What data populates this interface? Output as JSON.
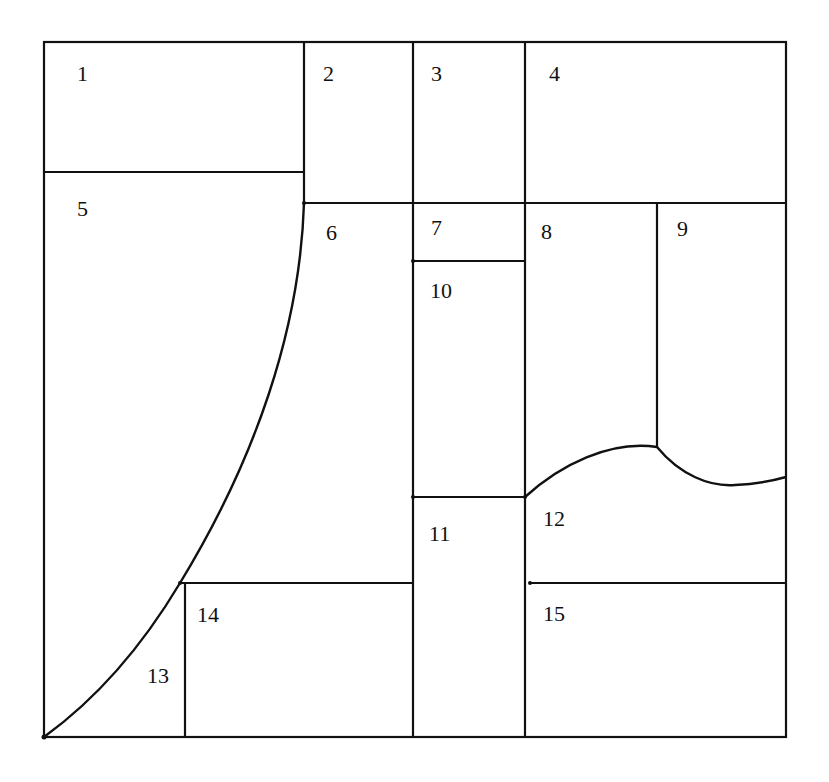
{
  "diagram": {
    "type": "dissection-puzzle",
    "stroke_color": "#111111",
    "background": "#ffffff",
    "regions": [
      {
        "id": "1",
        "label": "1",
        "x": 77,
        "y": 81
      },
      {
        "id": "2",
        "label": "2",
        "x": 323,
        "y": 81
      },
      {
        "id": "3",
        "label": "3",
        "x": 431,
        "y": 81
      },
      {
        "id": "4",
        "label": "4",
        "x": 549,
        "y": 81
      },
      {
        "id": "5",
        "label": "5",
        "x": 77,
        "y": 216
      },
      {
        "id": "6",
        "label": "6",
        "x": 326,
        "y": 240
      },
      {
        "id": "7",
        "label": "7",
        "x": 431,
        "y": 235
      },
      {
        "id": "8",
        "label": "8",
        "x": 541,
        "y": 239
      },
      {
        "id": "9",
        "label": "9",
        "x": 677,
        "y": 236
      },
      {
        "id": "10",
        "label": "10",
        "x": 430,
        "y": 298
      },
      {
        "id": "11",
        "label": "11",
        "x": 429,
        "y": 541
      },
      {
        "id": "12",
        "label": "12",
        "x": 543,
        "y": 526
      },
      {
        "id": "13",
        "label": "13",
        "x": 147,
        "y": 683
      },
      {
        "id": "14",
        "label": "14",
        "x": 197,
        "y": 622
      },
      {
        "id": "15",
        "label": "15",
        "x": 543,
        "y": 621
      }
    ]
  }
}
